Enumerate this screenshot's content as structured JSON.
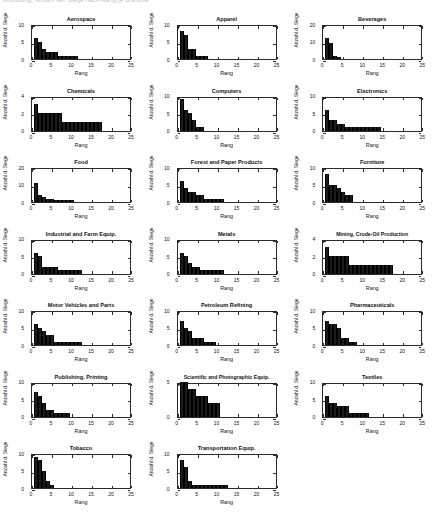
{
  "header": {
    "clipped_text": "Abbildung: Anzahl der Siege nach Rang je Branche"
  },
  "figure": {
    "xlabel": "Rang",
    "ylabel": "Anzahl d. Siege",
    "xticks": [
      0,
      5,
      10,
      15,
      20,
      25
    ],
    "xlim": [
      0,
      25
    ]
  },
  "chart_data": [
    {
      "type": "bar",
      "title": "Aerospace",
      "xlabel": "Rang",
      "ylabel": "Anzahl d. Siege",
      "xlim": [
        0,
        25
      ],
      "ylim": [
        0,
        10
      ],
      "yticks": [
        0,
        5,
        10
      ],
      "xticks": [
        0,
        5,
        10,
        15,
        20,
        25
      ],
      "grid": false,
      "categories": [
        1,
        2,
        3,
        4,
        5,
        6,
        7,
        8,
        9,
        10,
        11
      ],
      "values": [
        6,
        5,
        3,
        2,
        2,
        2,
        1,
        1,
        1,
        1,
        1
      ]
    },
    {
      "type": "bar",
      "title": "Apparel",
      "xlabel": "Rang",
      "ylabel": "Anzahl d. Siege",
      "xlim": [
        0,
        25
      ],
      "ylim": [
        0,
        10
      ],
      "yticks": [
        0,
        5,
        10
      ],
      "xticks": [
        0,
        5,
        10,
        15,
        20,
        25
      ],
      "grid": false,
      "categories": [
        1,
        2,
        3,
        4,
        5,
        6,
        7
      ],
      "values": [
        8,
        7,
        3,
        3,
        1,
        1,
        1
      ]
    },
    {
      "type": "bar",
      "title": "Beverages",
      "xlabel": "Rang",
      "ylabel": "Anzahl d. Siege",
      "xlim": [
        0,
        25
      ],
      "ylim": [
        0,
        20
      ],
      "yticks": [
        0,
        10,
        20
      ],
      "xticks": [
        0,
        5,
        10,
        15,
        20,
        25
      ],
      "grid": false,
      "categories": [
        1,
        2,
        3,
        4
      ],
      "values": [
        12,
        9,
        2,
        1
      ]
    },
    {
      "type": "bar",
      "title": "Chemicals",
      "xlabel": "Rang",
      "ylabel": "Anzahl d. Siege",
      "xlim": [
        0,
        25
      ],
      "ylim": [
        0,
        4
      ],
      "yticks": [
        0,
        2,
        4
      ],
      "xticks": [
        0,
        5,
        10,
        15,
        20,
        25
      ],
      "grid": false,
      "categories": [
        1,
        2,
        3,
        4,
        5,
        6,
        7,
        8,
        9,
        10,
        11,
        12,
        13,
        14,
        15,
        16,
        17
      ],
      "values": [
        3,
        2,
        2,
        2,
        2,
        2,
        2,
        1,
        1,
        1,
        1,
        1,
        1,
        1,
        1,
        1,
        1
      ]
    },
    {
      "type": "bar",
      "title": "Computers",
      "xlabel": "Rang",
      "ylabel": "Anzahl d. Siege",
      "xlim": [
        0,
        25
      ],
      "ylim": [
        0,
        10
      ],
      "yticks": [
        0,
        5,
        10
      ],
      "xticks": [
        0,
        5,
        10,
        15,
        20,
        25
      ],
      "grid": false,
      "categories": [
        1,
        2,
        3,
        4,
        5,
        6
      ],
      "values": [
        9,
        6,
        5,
        3,
        1,
        1
      ]
    },
    {
      "type": "bar",
      "title": "Electronics",
      "xlabel": "Rang",
      "ylabel": "Anzahl d. Siege",
      "xlim": [
        0,
        25
      ],
      "ylim": [
        0,
        10
      ],
      "yticks": [
        0,
        5,
        10
      ],
      "xticks": [
        0,
        5,
        10,
        15,
        20,
        25
      ],
      "grid": false,
      "categories": [
        1,
        2,
        3,
        4,
        5,
        6,
        7,
        8,
        9,
        10,
        11,
        12,
        13,
        14
      ],
      "values": [
        6,
        3,
        3,
        2,
        2,
        1,
        1,
        1,
        1,
        1,
        1,
        1,
        1,
        1
      ]
    },
    {
      "type": "bar",
      "title": "Food",
      "xlabel": "Rang",
      "ylabel": "Anzahl d. Siege",
      "xlim": [
        0,
        25
      ],
      "ylim": [
        0,
        20
      ],
      "yticks": [
        0,
        10,
        20
      ],
      "xticks": [
        0,
        5,
        10,
        15,
        20,
        25
      ],
      "grid": false,
      "categories": [
        1,
        2,
        3,
        4,
        5,
        6,
        7,
        8,
        9,
        10
      ],
      "values": [
        11,
        4,
        3,
        2,
        2,
        1,
        1,
        1,
        1,
        1
      ]
    },
    {
      "type": "bar",
      "title": "Forest and Paper Products",
      "xlabel": "Rang",
      "ylabel": "Anzahl d. Siege",
      "xlim": [
        0,
        25
      ],
      "ylim": [
        0,
        10
      ],
      "yticks": [
        0,
        5,
        10
      ],
      "xticks": [
        0,
        5,
        10,
        15,
        20,
        25
      ],
      "grid": false,
      "categories": [
        1,
        2,
        3,
        4,
        5,
        6,
        7,
        8,
        9,
        10,
        11
      ],
      "values": [
        6,
        4,
        3,
        3,
        2,
        2,
        1,
        1,
        1,
        1,
        1
      ]
    },
    {
      "type": "bar",
      "title": "Furniture",
      "xlabel": "Rang",
      "ylabel": "Anzahl d. Siege",
      "xlim": [
        0,
        25
      ],
      "ylim": [
        0,
        10
      ],
      "yticks": [
        0,
        5,
        10
      ],
      "xticks": [
        0,
        5,
        10,
        15,
        20,
        25
      ],
      "grid": false,
      "categories": [
        1,
        2,
        3,
        4,
        5,
        6,
        7
      ],
      "values": [
        8,
        5,
        5,
        4,
        3,
        2,
        2
      ]
    },
    {
      "type": "bar",
      "title": "Industrial and Farm Equip.",
      "xlabel": "Rang",
      "ylabel": "Anzahl d. Siege",
      "xlim": [
        0,
        25
      ],
      "ylim": [
        0,
        10
      ],
      "yticks": [
        0,
        5,
        10
      ],
      "xticks": [
        0,
        5,
        10,
        15,
        20,
        25
      ],
      "grid": false,
      "categories": [
        1,
        2,
        3,
        4,
        5,
        6,
        7,
        8,
        9,
        10,
        11,
        12
      ],
      "values": [
        6,
        5,
        2,
        2,
        2,
        2,
        1,
        1,
        1,
        1,
        1,
        1
      ]
    },
    {
      "type": "bar",
      "title": "Metals",
      "xlabel": "Rang",
      "ylabel": "Anzahl d. Siege",
      "xlim": [
        0,
        25
      ],
      "ylim": [
        0,
        10
      ],
      "yticks": [
        0,
        5,
        10
      ],
      "xticks": [
        0,
        5,
        10,
        15,
        20,
        25
      ],
      "grid": false,
      "categories": [
        1,
        2,
        3,
        4,
        5,
        6,
        7,
        8,
        9,
        10,
        11
      ],
      "values": [
        6,
        5,
        3,
        2,
        2,
        1,
        1,
        1,
        1,
        1,
        1
      ]
    },
    {
      "type": "bar",
      "title": "Mining, Crude-Oil Production",
      "xlabel": "Rang",
      "ylabel": "Anzahl d. Siege",
      "xlim": [
        0,
        25
      ],
      "ylim": [
        0,
        4
      ],
      "yticks": [
        0,
        2,
        4
      ],
      "xticks": [
        0,
        5,
        10,
        15,
        20,
        25
      ],
      "grid": false,
      "categories": [
        1,
        2,
        3,
        4,
        5,
        6,
        7,
        8,
        9,
        10,
        11,
        12,
        13,
        14,
        15,
        16,
        17
      ],
      "values": [
        3,
        2,
        2,
        2,
        2,
        2,
        1,
        1,
        1,
        1,
        1,
        1,
        1,
        1,
        1,
        1,
        1
      ]
    },
    {
      "type": "bar",
      "title": "Motor Vehicles and Parts",
      "xlabel": "Rang",
      "ylabel": "Anzahl d. Siege",
      "xlim": [
        0,
        25
      ],
      "ylim": [
        0,
        10
      ],
      "yticks": [
        0,
        5,
        10
      ],
      "xticks": [
        0,
        5,
        10,
        15,
        20,
        25
      ],
      "grid": false,
      "categories": [
        1,
        2,
        3,
        4,
        5,
        6,
        7,
        8,
        9,
        10,
        11,
        12
      ],
      "values": [
        6,
        5,
        4,
        3,
        3,
        1,
        1,
        1,
        1,
        1,
        1,
        1
      ]
    },
    {
      "type": "bar",
      "title": "Petroleum Refining",
      "xlabel": "Rang",
      "ylabel": "Anzahl d. Siege",
      "xlim": [
        0,
        25
      ],
      "ylim": [
        0,
        10
      ],
      "yticks": [
        0,
        5,
        10
      ],
      "xticks": [
        0,
        5,
        10,
        15,
        20,
        25
      ],
      "grid": false,
      "categories": [
        1,
        2,
        3,
        4,
        5,
        6,
        7,
        8,
        9
      ],
      "values": [
        7,
        5,
        4,
        2,
        2,
        2,
        1,
        1,
        1
      ]
    },
    {
      "type": "bar",
      "title": "Pharmaceuticals",
      "xlabel": "Rang",
      "ylabel": "Anzahl d. Siege",
      "xlim": [
        0,
        25
      ],
      "ylim": [
        0,
        10
      ],
      "yticks": [
        0,
        5,
        10
      ],
      "xticks": [
        0,
        5,
        10,
        15,
        20,
        25
      ],
      "grid": false,
      "categories": [
        1,
        2,
        3,
        4,
        5,
        6,
        7,
        8
      ],
      "values": [
        7,
        6,
        6,
        5,
        2,
        2,
        1,
        1
      ]
    },
    {
      "type": "bar",
      "title": "Publishing, Printing",
      "xlabel": "Rang",
      "ylabel": "Anzahl d. Siege",
      "xlim": [
        0,
        25
      ],
      "ylim": [
        0,
        10
      ],
      "yticks": [
        0,
        5,
        10
      ],
      "xticks": [
        0,
        5,
        10,
        15,
        20,
        25
      ],
      "grid": false,
      "categories": [
        1,
        2,
        3,
        4,
        5,
        6,
        7,
        8,
        9
      ],
      "values": [
        7,
        6,
        4,
        2,
        2,
        1,
        1,
        1,
        1
      ]
    },
    {
      "type": "bar",
      "title": "Scientific and Photographic Equip.",
      "xlabel": "Rang",
      "ylabel": "Anzahl d. Siege",
      "xlim": [
        0,
        25
      ],
      "ylim": [
        0,
        5
      ],
      "yticks": [
        0,
        5
      ],
      "xticks": [
        0,
        5,
        10,
        15,
        20,
        25
      ],
      "grid": false,
      "categories": [
        1,
        2,
        3,
        4,
        5,
        6,
        7,
        8,
        9,
        10
      ],
      "values": [
        5,
        5,
        4,
        4,
        3,
        3,
        3,
        2,
        2,
        2
      ]
    },
    {
      "type": "bar",
      "title": "Textiles",
      "xlabel": "Rang",
      "ylabel": "Anzahl d. Siege",
      "xlim": [
        0,
        25
      ],
      "ylim": [
        0,
        10
      ],
      "yticks": [
        0,
        5,
        10
      ],
      "xticks": [
        0,
        5,
        10,
        15,
        20,
        25
      ],
      "grid": false,
      "categories": [
        1,
        2,
        3,
        4,
        5,
        6,
        7,
        8,
        9,
        10,
        11
      ],
      "values": [
        6,
        4,
        4,
        3,
        3,
        3,
        1,
        1,
        1,
        1,
        1
      ]
    },
    {
      "type": "bar",
      "title": "Tobacco",
      "xlabel": "Rang",
      "ylabel": "Anzahl d. Siege",
      "xlim": [
        0,
        25
      ],
      "ylim": [
        0,
        10
      ],
      "yticks": [
        0,
        5,
        10
      ],
      "xticks": [
        0,
        5,
        10,
        15,
        20,
        25
      ],
      "grid": false,
      "categories": [
        1,
        2,
        3,
        4,
        5
      ],
      "values": [
        9,
        8,
        5,
        2,
        1
      ]
    },
    {
      "type": "bar",
      "title": "Transportation Equip.",
      "xlabel": "Rang",
      "ylabel": "Anzahl d. Siege",
      "xlim": [
        0,
        25
      ],
      "ylim": [
        0,
        10
      ],
      "yticks": [
        0,
        5,
        10
      ],
      "xticks": [
        0,
        5,
        10,
        15,
        20,
        25
      ],
      "grid": false,
      "categories": [
        1,
        2,
        3,
        4,
        5,
        6,
        7,
        8,
        9,
        10,
        11,
        12
      ],
      "values": [
        8,
        6,
        2,
        1,
        1,
        1,
        1,
        1,
        1,
        1,
        1,
        1
      ]
    }
  ],
  "colors": {
    "bar": "#1c1c1c",
    "axis": "#2b2b2b",
    "background": "#ffffff",
    "text": "#111111"
  }
}
